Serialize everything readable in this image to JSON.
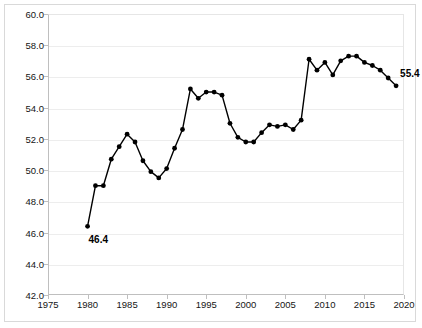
{
  "chart_data": {
    "type": "line",
    "title": "",
    "subtitle": "",
    "xlabel": "",
    "ylabel": "",
    "xlim": [
      1975,
      2020
    ],
    "ylim": [
      42.0,
      60.0
    ],
    "grid": true,
    "legend": null,
    "legend_position": "none",
    "line_color": "#000000",
    "marker": "circle",
    "marker_color": "#000000",
    "x_ticks": [
      1975,
      1980,
      1985,
      1990,
      1995,
      2000,
      2005,
      2010,
      2015,
      2020
    ],
    "x_tick_labels": [
      "1975",
      "1980",
      "1985",
      "1990",
      "1995",
      "2000",
      "2005",
      "2010",
      "2015",
      "2020"
    ],
    "y_ticks": [
      42.0,
      44.0,
      46.0,
      48.0,
      50.0,
      52.0,
      54.0,
      56.0,
      58.0,
      60.0
    ],
    "y_tick_labels": [
      "42.0",
      "44.0",
      "46.0",
      "48.0",
      "50.0",
      "52.0",
      "54.0",
      "56.0",
      "58.0",
      "60.0"
    ],
    "x": [
      1980,
      1981,
      1982,
      1983,
      1984,
      1985,
      1986,
      1987,
      1988,
      1989,
      1990,
      1991,
      1992,
      1993,
      1994,
      1995,
      1996,
      1997,
      1998,
      1999,
      2000,
      2001,
      2002,
      2003,
      2004,
      2005,
      2006,
      2007,
      2008,
      2009,
      2010,
      2011,
      2012,
      2013,
      2014,
      2015,
      2016,
      2017,
      2018,
      2019
    ],
    "values": [
      46.4,
      49.0,
      49.0,
      50.7,
      51.5,
      52.3,
      51.8,
      50.6,
      49.9,
      49.5,
      50.1,
      51.4,
      52.6,
      55.2,
      54.6,
      55.0,
      55.0,
      54.8,
      53.0,
      52.1,
      51.8,
      51.8,
      52.4,
      52.9,
      52.8,
      52.9,
      52.6,
      53.2,
      57.1,
      56.4,
      56.9,
      56.1,
      57.0,
      57.3,
      57.3,
      56.9,
      56.7,
      56.4,
      55.9,
      55.4
    ],
    "annotations": [
      {
        "label": "46.4",
        "x": 1980,
        "y": 46.4,
        "position": "below-right"
      },
      {
        "label": "55.4",
        "x": 2019,
        "y": 55.4,
        "position": "above-right"
      }
    ]
  }
}
